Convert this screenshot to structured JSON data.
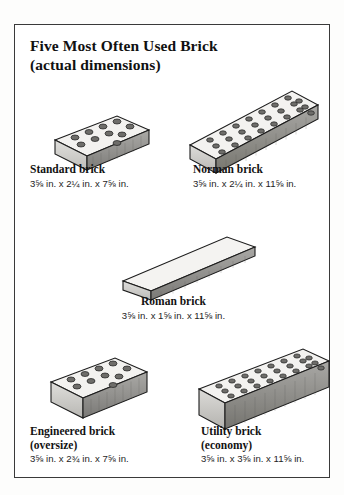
{
  "figure": {
    "title_line1": "Five Most Often Used Brick",
    "title_line2": "(actual dimensions)",
    "border_color": "#3a3a3a",
    "background_color": "#ffffff"
  },
  "bricks": [
    {
      "id": "standard",
      "name": "Standard brick",
      "subtitle": "",
      "dimensions": "3⅝ in. x 2¼ in. x 7⅝ in.",
      "thickness_in": "3⅝",
      "height_in": "2¼",
      "length_in": "7⅝",
      "hole_rows": 2,
      "hole_cols": 5,
      "hole_count": 10,
      "icon": "brick-isometric-icon"
    },
    {
      "id": "norman",
      "name": "Norman brick",
      "subtitle": "",
      "dimensions": "3⅝ in. x 2¼ in. x 11⅝ in.",
      "thickness_in": "3⅝",
      "height_in": "2¼",
      "length_in": "11⅝",
      "hole_rows": 3,
      "hole_cols": 8,
      "hole_count": 24,
      "icon": "brick-isometric-icon"
    },
    {
      "id": "roman",
      "name": "Roman brick",
      "subtitle": "",
      "dimensions": "3⅝ in. x 1⅝ in. x 11⅝ in.",
      "thickness_in": "3⅝",
      "height_in": "1⅝",
      "length_in": "11⅝",
      "hole_rows": 0,
      "hole_cols": 0,
      "hole_count": 0,
      "icon": "brick-isometric-icon"
    },
    {
      "id": "engineered",
      "name": "Engineered brick",
      "subtitle": "(oversize)",
      "dimensions": "3⅝ in. x 2¾ in. x 7⅝ in.",
      "thickness_in": "3⅝",
      "height_in": "2¾",
      "length_in": "7⅝",
      "hole_rows": 2,
      "hole_cols": 5,
      "hole_count": 10,
      "icon": "brick-isometric-icon"
    },
    {
      "id": "utility",
      "name": "Utility brick",
      "subtitle": "(economy)",
      "dimensions": "3⅝ in. x 3⅝ in. x 11⅝ in.",
      "thickness_in": "3⅝",
      "height_in": "3⅝",
      "length_in": "11⅝",
      "hole_rows": 3,
      "hole_cols": 8,
      "hole_count": 24,
      "icon": "brick-isometric-icon"
    }
  ],
  "palette": {
    "top_face": "#f2f1ef",
    "front_face": "#cfcecb",
    "side_face": "#8f8e8b",
    "outline": "#1c1c1c",
    "hole_fill": "#6e6d6a"
  }
}
